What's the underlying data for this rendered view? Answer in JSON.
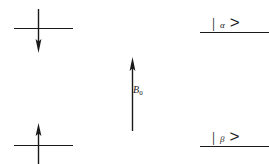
{
  "figure": {
    "stroke_color": "#1a1a1a",
    "background_color": "#ffffff"
  },
  "field": {
    "arrow_direction": "up",
    "label_symbol": "B",
    "label_subscript": "0",
    "label_text": "B0"
  },
  "levels": {
    "upper": {
      "spin_arrow_direction": "down",
      "state_bar": "|",
      "state_symbol": "α",
      "state_angle": ">",
      "state_label": "| α >"
    },
    "lower": {
      "spin_arrow_direction": "up",
      "state_bar": "|",
      "state_symbol": "β",
      "state_angle": ">",
      "state_label": "| β >"
    }
  }
}
